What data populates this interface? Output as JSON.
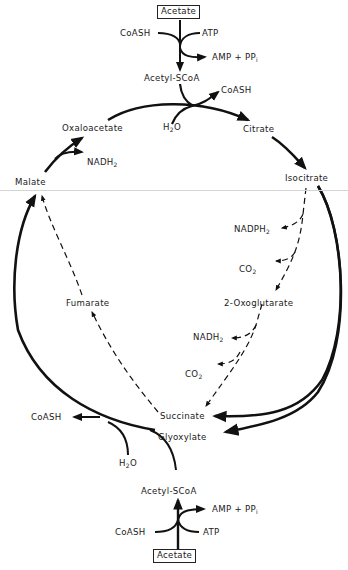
{
  "diagram": {
    "nodes": {
      "acetate_top": "Acetate",
      "coash_top_in": "CoASH",
      "atp_top": "ATP",
      "amp_ppi_top": "AMP + PP",
      "amp_ppi_top_sub": "i",
      "acetyl_scoa_top": "Acetyl-SCoA",
      "coash_top_out": "CoASH",
      "h2o_top": "H",
      "h2o_top_sub": "2",
      "h2o_top_tail": "O",
      "oxaloacetate": "Oxaloacetate",
      "citrate": "Citrate",
      "nadh2_top": "NADH",
      "nadh2_top_sub": "2",
      "malate": "Malate",
      "isocitrate": "Isocitrate",
      "nadph2": "NADPH",
      "nadph2_sub": "2",
      "co2_upper": "CO",
      "co2_upper_sub": "2",
      "fumarate": "Fumarate",
      "oxoglutarate": "2-Oxoglutarate",
      "nadh2_lower": "NADH",
      "nadh2_lower_sub": "2",
      "co2_lower": "CO",
      "co2_lower_sub": "2",
      "succinate": "Succinate",
      "coash_bottom_out": "CoASH",
      "glyoxylate": "Glyoxylate",
      "h2o_bottom": "H",
      "h2o_bottom_sub": "2",
      "h2o_bottom_tail": "O",
      "acetyl_scoa_bottom": "Acetyl-SCoA",
      "amp_ppi_bottom": "AMP + PP",
      "amp_ppi_bottom_sub": "i",
      "coash_bottom_in": "CoASH",
      "atp_bottom": "ATP",
      "acetate_bottom": "Acetate"
    },
    "edges": [
      {
        "from": "Acetate",
        "to": "Acetyl-SCoA",
        "style": "solid",
        "cofactors_in": [
          "CoASH",
          "ATP"
        ],
        "cofactors_out": [
          "AMP + PPi"
        ]
      },
      {
        "from": "Oxaloacetate",
        "to": "Citrate",
        "style": "solid",
        "cofactors_in": [
          "Acetyl-SCoA",
          "H2O"
        ],
        "cofactors_out": [
          "CoASH"
        ]
      },
      {
        "from": "Citrate",
        "to": "Isocitrate",
        "style": "solid"
      },
      {
        "from": "Isocitrate",
        "to": "2-Oxoglutarate",
        "style": "dashed",
        "cofactors_out": [
          "NADPH2",
          "CO2"
        ]
      },
      {
        "from": "2-Oxoglutarate",
        "to": "Succinate",
        "style": "dashed",
        "cofactors_out": [
          "NADH2",
          "CO2"
        ]
      },
      {
        "from": "Succinate",
        "to": "Fumarate",
        "style": "dashed"
      },
      {
        "from": "Fumarate",
        "to": "Malate",
        "style": "dashed"
      },
      {
        "from": "Isocitrate",
        "to": "Succinate",
        "style": "solid"
      },
      {
        "from": "Isocitrate",
        "to": "Glyoxylate",
        "style": "solid"
      },
      {
        "from": "Glyoxylate",
        "to": "Malate",
        "style": "solid",
        "cofactors_in": [
          "Acetyl-SCoA",
          "H2O"
        ],
        "cofactors_out": [
          "CoASH"
        ]
      },
      {
        "from": "Malate",
        "to": "Oxaloacetate",
        "style": "solid",
        "cofactors_out": [
          "NADH2"
        ]
      }
    ],
    "colors": {
      "ink": "#111111",
      "divider": "#d4d4d4",
      "background": "#ffffff"
    }
  }
}
